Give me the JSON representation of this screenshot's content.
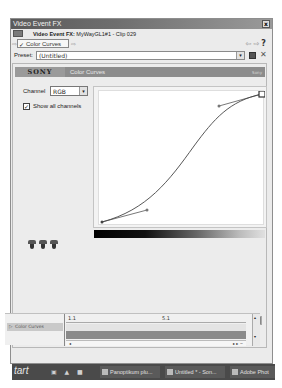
{
  "window": {
    "title": "Video Event FX",
    "close_label": "x"
  },
  "subtitle": {
    "prefix": "Video Event FX:",
    "clip": "MyWayGL1#1 - Clip 029"
  },
  "chain": {
    "in_arrow": "⇨",
    "plugin_check": "✓",
    "plugin_label": "Color Curves",
    "out_arrow": "⇨",
    "right_arrows": "⇦ ⇨",
    "help": "?"
  },
  "preset": {
    "label": "Preset:",
    "value": "(Untitled)",
    "dropdown": "▾",
    "delete": "✕"
  },
  "plugin_header": {
    "logo": "SONY",
    "name": "Color Curves",
    "brand": "Sony"
  },
  "channel": {
    "label": "Channel",
    "value": "RGB",
    "dropdown": "▾"
  },
  "show_all": {
    "checked": "✓",
    "label": "Show all channels"
  },
  "curve": {
    "points": [
      {
        "name": "start",
        "x": 0,
        "y": 0
      },
      {
        "name": "end",
        "x": 1,
        "y": 1
      }
    ],
    "handles": [
      {
        "from": "start",
        "x": 0.3,
        "y": 0.08
      },
      {
        "from": "end",
        "x": 0.73,
        "y": 0.9
      }
    ]
  },
  "scroll": {
    "left": "◂",
    "right": "▸"
  },
  "timeline": {
    "track_arrow": "▷",
    "track_label": "Color Curves",
    "ruler": [
      "1.1",
      "5.1"
    ],
    "hs_left": "◂",
    "hs_right": "▸ ▸ −",
    "vs_up": "▴",
    "vs_down": "▾"
  },
  "taskbar": {
    "start": "tart",
    "quicklaunch": "▣ ▲ ■",
    "tasks": [
      "Panoptikum plu...",
      "Untitled * - Son...",
      "Adobe Phot"
    ]
  }
}
